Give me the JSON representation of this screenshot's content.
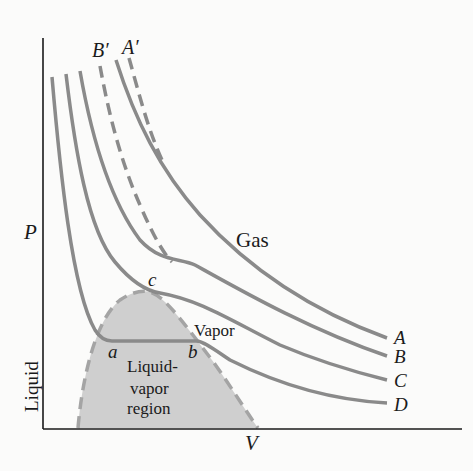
{
  "diagram": {
    "axes": {
      "x_label": "V",
      "y_label": "P"
    },
    "curve_labels": [
      "A",
      "B",
      "C",
      "D"
    ],
    "ideal_labels": [
      "A′",
      "B′"
    ],
    "points": {
      "a": "a",
      "b": "b",
      "c": "c"
    },
    "regions": {
      "gas": "Gas",
      "vapor": "Vapor",
      "liquid": "Liquid",
      "liquid_vapor_1": "Liquid-",
      "liquid_vapor_2": "vapor",
      "liquid_vapor_3": "region"
    },
    "colors": {
      "curve": "#8a8a8a",
      "region_fill": "#cfcfcf",
      "axis": "#1a1a1a",
      "dashed": "#a0a0a0"
    }
  }
}
